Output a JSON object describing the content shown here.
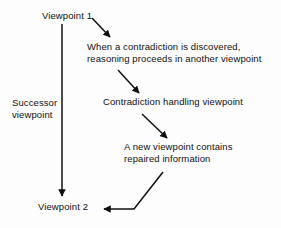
{
  "diagram": {
    "type": "flow-diagram",
    "background_color": "#fdfdfd",
    "stroke_color": "#101010",
    "nodes": {
      "viewpoint_1": {
        "label": "Viewpoint 1"
      },
      "viewpoint_2": {
        "label": "Viewpoint 2"
      },
      "step_1": {
        "line_1": "When a contradiction is discovered,",
        "line_2": "reasoning proceeds in another viewpoint"
      },
      "step_2": {
        "line_1": "Contradiction handling viewpoint"
      },
      "step_3": {
        "line_1": "A new viewpoint contains",
        "line_2": "repaired information"
      }
    },
    "edges": {
      "successor": {
        "label_line_1": "Successor",
        "label_line_2": "viewpoint"
      }
    }
  }
}
